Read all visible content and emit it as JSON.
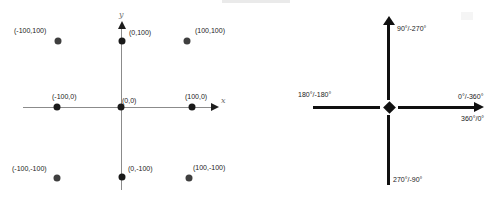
{
  "left_diagram": {
    "description": "Cartesian coordinate plane with nine labeled sample points",
    "x_axis_label": "x",
    "y_axis_label": "y",
    "points": [
      {
        "x": -100,
        "y": 100,
        "label": "(-100,100)"
      },
      {
        "x": 0,
        "y": 100,
        "label": "(0,100)"
      },
      {
        "x": 100,
        "y": 100,
        "label": "(100,100)"
      },
      {
        "x": -100,
        "y": 0,
        "label": "(-100,0)"
      },
      {
        "x": 0,
        "y": 0,
        "label": "(0,0)"
      },
      {
        "x": 100,
        "y": 0,
        "label": "(100,0)"
      },
      {
        "x": -100,
        "y": -100,
        "label": "(-100,-100)"
      },
      {
        "x": 0,
        "y": -100,
        "label": "(0,-100)"
      },
      {
        "x": 100,
        "y": -100,
        "label": "(100,-100)"
      }
    ]
  },
  "right_diagram": {
    "description": "Angle direction cross showing equivalent positive/negative rotations",
    "up_label": "90°/-270°",
    "left_label": "180°/-180°",
    "right_label_top": "0°/-360°",
    "right_label_bottom": "360°/0°",
    "down_label": "270°/-90°"
  },
  "colors": {
    "background": "#ffffff",
    "axis_gray": "#8b8b8b",
    "ink": "#101010",
    "corner_dot_gray": "#3f3f3f"
  }
}
